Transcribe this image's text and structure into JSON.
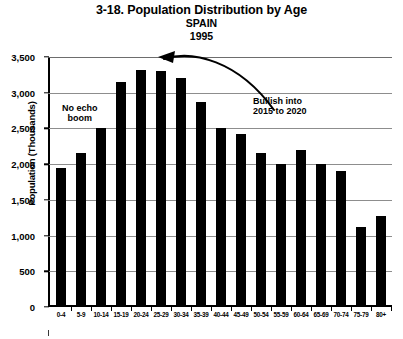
{
  "chart_data": {
    "type": "bar",
    "title": "3-18. Population Distribution by Age",
    "subtitle": "SPAIN",
    "year": "1995",
    "xlabel": "",
    "ylabel": "Population (Thousands)",
    "ylim": [
      0,
      3500
    ],
    "ytick_values": [
      3500,
      3000,
      2500,
      2000,
      1500,
      1000,
      500,
      0
    ],
    "ytick_labels": [
      "3,500",
      "3,000",
      "2,500",
      "2,000",
      "1,500",
      "1,000",
      "500",
      "0"
    ],
    "grid": true,
    "legend": null,
    "categories": [
      "0-4",
      "5-9",
      "10-14",
      "15-19",
      "20-24",
      "25-29",
      "30-34",
      "35-39",
      "40-44",
      "45-49",
      "50-54",
      "55-59",
      "60-64",
      "65-69",
      "70-74",
      "75-79",
      "80+"
    ],
    "values": [
      1950,
      2150,
      2500,
      3150,
      3320,
      3300,
      3200,
      2870,
      2500,
      2420,
      2150,
      2000,
      2200,
      2000,
      1900,
      1120,
      1280
    ],
    "annotations": [
      {
        "id": "no-echo-boom",
        "text_lines": [
          "No echo",
          "boom"
        ],
        "text": "No echo boom"
      },
      {
        "id": "bullish",
        "text_lines": [
          "Bullish into",
          "2015 to 2020"
        ],
        "text": "Bullish into 2015 to 2020",
        "arrow": "curved-arrow-pointing-left"
      }
    ]
  },
  "colors": {
    "bar": "#000000",
    "grid": "#8d8d8d",
    "axis": "#000000",
    "background": "#ffffff",
    "text": "#000000"
  }
}
